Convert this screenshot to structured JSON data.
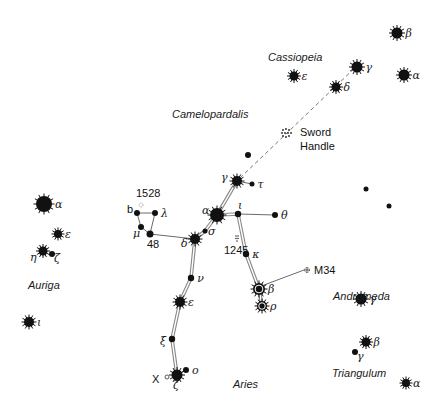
{
  "colors": {
    "ink": "#111111",
    "background": "#ffffff",
    "line": "#777777"
  },
  "constellations": {
    "cassiopeia": {
      "label": "Cassiopeia",
      "x": 268,
      "y": 61
    },
    "camelopardalis": {
      "label": "Camelopardalis",
      "x": 172,
      "y": 118
    },
    "auriga": {
      "label": "Auriga",
      "x": 28,
      "y": 289
    },
    "andromeda": {
      "label": "Andromeda",
      "x": 333,
      "y": 300
    },
    "aries": {
      "label": "Aries",
      "x": 233,
      "y": 388
    },
    "triangulum": {
      "label": "Triangulum",
      "x": 332,
      "y": 377
    }
  },
  "objects": {
    "sword_handle": {
      "label_line1": "Sword",
      "label_line2": "Handle"
    },
    "m34": {
      "label": "M34"
    },
    "ngc1245": {
      "label": "1245"
    },
    "ngc1528": {
      "label": "1528"
    },
    "star48": {
      "label": "48"
    },
    "starX": {
      "label": "X"
    }
  },
  "stars": {
    "cas_beta": {
      "greek": "β",
      "x": 397,
      "y": 33,
      "r": 5.5,
      "type": "spiky"
    },
    "cas_gamma": {
      "greek": "γ",
      "x": 357,
      "y": 67,
      "r": 5.5,
      "type": "spiky"
    },
    "cas_alpha": {
      "greek": "α",
      "x": 404,
      "y": 75,
      "r": 5.5,
      "type": "spiky"
    },
    "cas_eps": {
      "greek": "ε",
      "x": 294,
      "y": 76,
      "r": 4.5,
      "type": "spiky"
    },
    "cas_delta": {
      "greek": "δ",
      "x": 336,
      "y": 87,
      "r": 4.5,
      "type": "spiky"
    },
    "per_gamma": {
      "greek": "γ",
      "x": 237,
      "y": 181,
      "r": 5,
      "type": "spiky"
    },
    "per_tau": {
      "greek": "τ",
      "x": 252,
      "y": 184,
      "r": 2.5,
      "type": "dot"
    },
    "per_alpha": {
      "greek": "α",
      "x": 217,
      "y": 215,
      "r": 7,
      "type": "spiky"
    },
    "per_iota": {
      "greek": "ι",
      "x": 238,
      "y": 214,
      "r": 3.2,
      "type": "dot"
    },
    "per_theta": {
      "greek": "θ",
      "x": 275,
      "y": 215,
      "r": 3,
      "type": "dot"
    },
    "per_sigma": {
      "greek": "σ",
      "x": 205,
      "y": 231,
      "r": 2.5,
      "type": "dot"
    },
    "per_delta": {
      "greek": "δ",
      "x": 195,
      "y": 239,
      "r": 5,
      "type": "spiky"
    },
    "per_kappa": {
      "greek": "κ",
      "x": 246,
      "y": 254,
      "r": 3.2,
      "type": "dot"
    },
    "per_beta": {
      "greek": "β",
      "x": 259,
      "y": 289,
      "r": 6,
      "type": "variable"
    },
    "per_rho": {
      "greek": "ρ",
      "x": 262,
      "y": 306,
      "r": 5,
      "type": "variable"
    },
    "per_nu": {
      "greek": "ν",
      "x": 191,
      "y": 278,
      "r": 3.2,
      "type": "dot"
    },
    "per_eps": {
      "greek": "ε",
      "x": 180,
      "y": 302,
      "r": 5,
      "type": "spiky"
    },
    "per_xi": {
      "greek": "ξ",
      "x": 172,
      "y": 339,
      "r": 3.2,
      "type": "dot"
    },
    "per_zeta": {
      "greek": "ζ",
      "x": 177,
      "y": 375,
      "r": 5.5,
      "type": "spiky"
    },
    "per_omicron": {
      "greek": "ο",
      "x": 186,
      "y": 370,
      "r": 3,
      "type": "dot"
    },
    "per_b": {
      "greek": "b",
      "x": 137,
      "y": 213,
      "r": 3,
      "type": "dot"
    },
    "per_lambda": {
      "greek": "λ",
      "x": 155,
      "y": 213,
      "r": 3,
      "type": "dot"
    },
    "per_mu": {
      "greek": "μ",
      "x": 141,
      "y": 227,
      "r": 3,
      "type": "dot"
    },
    "per_48": {
      "greek": "",
      "x": 150,
      "y": 234,
      "r": 3.5,
      "type": "dot"
    },
    "aur_alpha": {
      "greek": "α",
      "x": 44,
      "y": 204,
      "r": 8,
      "type": "spiky"
    },
    "aur_eps": {
      "greek": "ε",
      "x": 58,
      "y": 234,
      "r": 4,
      "type": "spiky"
    },
    "aur_eta": {
      "greek": "η",
      "x": 43,
      "y": 251,
      "r": 4.5,
      "type": "spiky"
    },
    "aur_zeta": {
      "greek": "ζ",
      "x": 52,
      "y": 254,
      "r": 3,
      "type": "dot"
    },
    "aur_iota": {
      "greek": "ι",
      "x": 29,
      "y": 322,
      "r": 5,
      "type": "spiky"
    },
    "and_gamma": {
      "greek": "γ",
      "x": 361,
      "y": 299,
      "r": 5.5,
      "type": "spiky"
    },
    "and_dot1": {
      "greek": "",
      "x": 366,
      "y": 189,
      "r": 2.5,
      "type": "dot"
    },
    "and_dot2": {
      "greek": "",
      "x": 389,
      "y": 206,
      "r": 2.5,
      "type": "dot"
    },
    "cam_dot": {
      "greek": "",
      "x": 248,
      "y": 155,
      "r": 3,
      "type": "dot"
    },
    "tri_beta": {
      "greek": "β",
      "x": 366,
      "y": 342,
      "r": 4.5,
      "type": "spiky"
    },
    "tri_gamma": {
      "greek": "γ",
      "x": 355,
      "y": 352,
      "r": 3,
      "type": "dot"
    },
    "tri_alpha": {
      "greek": "α",
      "x": 406,
      "y": 383,
      "r": 4,
      "type": "spiky"
    }
  }
}
